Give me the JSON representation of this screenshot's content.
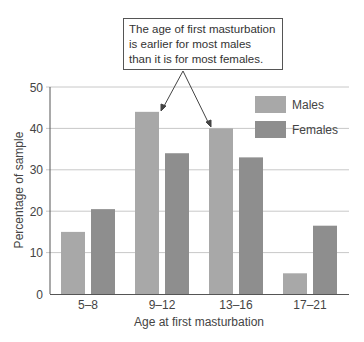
{
  "chart_data": {
    "type": "bar",
    "title": "",
    "xlabel": "Age at first masturbation",
    "ylabel": "Percentage of sample",
    "ylim": [
      0,
      50
    ],
    "yticks": [
      0,
      10,
      20,
      30,
      40,
      50
    ],
    "grid": true,
    "legend_position": "upper right",
    "categories": [
      "5–8",
      "9–12",
      "13–16",
      "17–21"
    ],
    "series": [
      {
        "name": "Males",
        "color": "#a8a8a8",
        "values": [
          15,
          44,
          40,
          5
        ]
      },
      {
        "name": "Females",
        "color": "#8e8e8e",
        "values": [
          20.5,
          34,
          33,
          16.5
        ]
      }
    ],
    "annotation": {
      "lines": [
        "The age of first masturbation",
        "is earlier for most males",
        "than it is for most females."
      ],
      "arrows_point_to": [
        "Males 9–12",
        "Males 13–16"
      ]
    }
  },
  "legend": {
    "males": "Males",
    "females": "Females"
  },
  "axis": {
    "x_title": "Age at first masturbation",
    "y_title": "Percentage of sample"
  }
}
